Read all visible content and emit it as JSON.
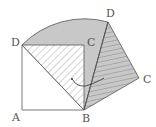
{
  "diagram": {
    "type": "geometry-rotation",
    "labels": {
      "A": "A",
      "B": "B",
      "C": "C",
      "D": "D",
      "D_rotated": "D",
      "C_rotated": "C"
    },
    "points": {
      "A": [
        22,
        110
      ],
      "B": [
        84,
        110
      ],
      "C": [
        84,
        45
      ],
      "D": [
        22,
        45
      ],
      "D_rotated": [
        108,
        22
      ],
      "C_rotated": [
        139,
        78
      ]
    },
    "colors": {
      "stroke": "#555555",
      "shade": "#c8c8c8",
      "hatch": "#777777"
    }
  }
}
